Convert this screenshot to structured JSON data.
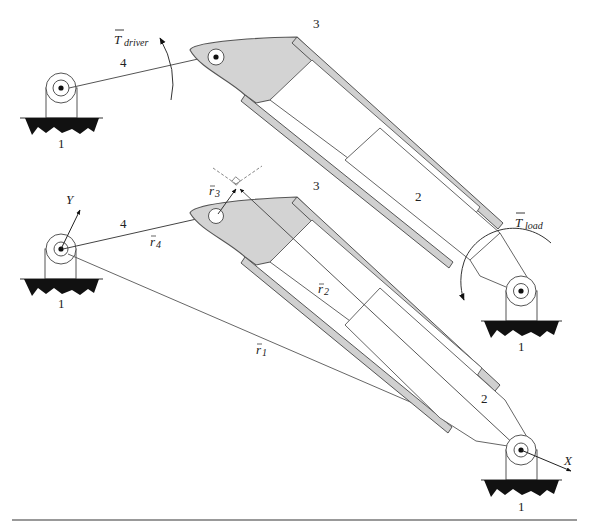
{
  "figure": {
    "type": "kinematic-diagram",
    "colors": {
      "background": "#ffffff",
      "link_fill": "#d3d3d3",
      "line": "#555555",
      "ground": "#111111",
      "bottom_rule": "#888888"
    }
  },
  "upper_view": {
    "torque_label": "T",
    "torque_subscript": "driver",
    "link_labels": {
      "ground_left": "1",
      "link4": "4",
      "link3": "3",
      "link2": "2"
    }
  },
  "lower_view": {
    "axis_y_label": "Y",
    "axis_x_label": "X",
    "torque_label": "T",
    "torque_subscript": "load",
    "link_labels": {
      "ground_left": "1",
      "ground_right_mid": "1",
      "ground_right_bottom": "1",
      "link4": "4",
      "link3": "3",
      "link2": "2"
    },
    "vectors": {
      "r1": {
        "base": "r",
        "sub": "1"
      },
      "r2": {
        "base": "r",
        "sub": "2"
      },
      "r3": {
        "base": "r",
        "sub": "3"
      },
      "r4": {
        "base": "r",
        "sub": "4"
      }
    }
  }
}
